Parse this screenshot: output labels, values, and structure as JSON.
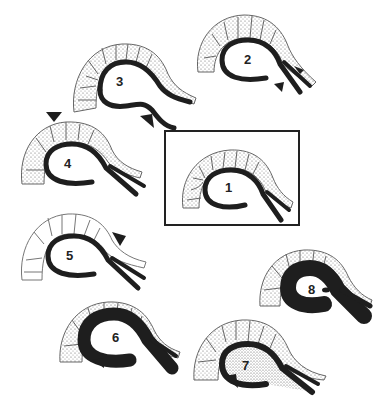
{
  "diagram": {
    "panels": [
      {
        "id": 1,
        "label": "1",
        "boxed": true,
        "arrow": "none",
        "fill": "white"
      },
      {
        "id": 2,
        "label": "2",
        "boxed": false,
        "arrow": "two arrows at neck, pointing inward",
        "fill": "white"
      },
      {
        "id": 3,
        "label": "3",
        "boxed": false,
        "arrow": "lower-right arrow pointing up-left toward bent duct",
        "fill": "white"
      },
      {
        "id": 4,
        "label": "4",
        "boxed": false,
        "arrow": "top arrow pointing down",
        "fill": "white"
      },
      {
        "id": 5,
        "label": "5",
        "boxed": false,
        "arrow": "upper-right arrow pointing down-left",
        "fill": "white"
      },
      {
        "id": 6,
        "label": "6",
        "boxed": false,
        "arrow": "lower-left arrow pointing left",
        "fill": "white",
        "wall": "thickened"
      },
      {
        "id": 7,
        "label": "7",
        "boxed": false,
        "arrow": "lower-left arrow pointing up-left",
        "fill": "stippled"
      },
      {
        "id": 8,
        "label": "8",
        "boxed": false,
        "arrow": "none",
        "fill": "white",
        "wall": "very thick",
        "inclusion": "small dark dot"
      }
    ]
  },
  "colors": {
    "ink": "#1e1e1e",
    "background": "#ffffff",
    "cell_ink": "#555555"
  }
}
